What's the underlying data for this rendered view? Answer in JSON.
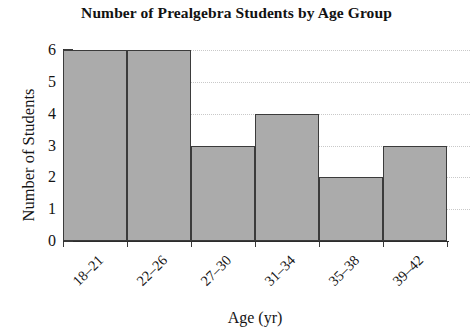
{
  "chart_data": {
    "type": "bar",
    "title": "Number of Prealgebra Students by Age Group",
    "xlabel": "Age (yr)",
    "ylabel": "Number of Students",
    "categories": [
      "18–21",
      "22–26",
      "27–30",
      "31–34",
      "35–38",
      "39–42"
    ],
    "values": [
      6,
      6,
      3,
      4,
      2,
      3
    ],
    "ylim": [
      0,
      6
    ],
    "ytick_labels": [
      "0",
      "1",
      "2",
      "3",
      "4",
      "5",
      "6"
    ],
    "ytick_values": [
      0,
      1,
      2,
      3,
      4,
      5,
      6
    ],
    "grid": true,
    "legend": "none",
    "bar_fill_color": "#ababab",
    "bar_edge_color": "#3b3b3b",
    "gridline_color": "#c9c9c9",
    "axis_color": "#2c2c2c",
    "background_color": "#ffffff"
  }
}
